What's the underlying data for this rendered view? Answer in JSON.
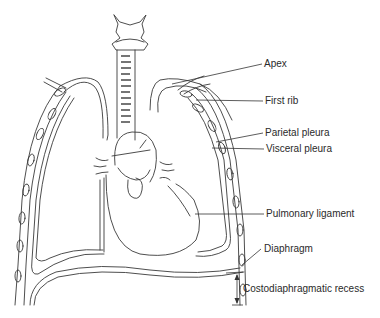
{
  "diagram": {
    "labels": {
      "apex": "Apex",
      "first_rib": "First rib",
      "parietal_pleura": "Parietal pleura",
      "visceral_pleura": "Visceral pleura",
      "pulmonary_ligament": "Pulmonary ligament",
      "diaphragm": "Diaphragm",
      "costodiaphragmatic_recess": "Costodiaphragmatic recess"
    },
    "colors": {
      "line": "#3a3a3a",
      "background": "#ffffff",
      "text": "#2a2a2a"
    }
  }
}
